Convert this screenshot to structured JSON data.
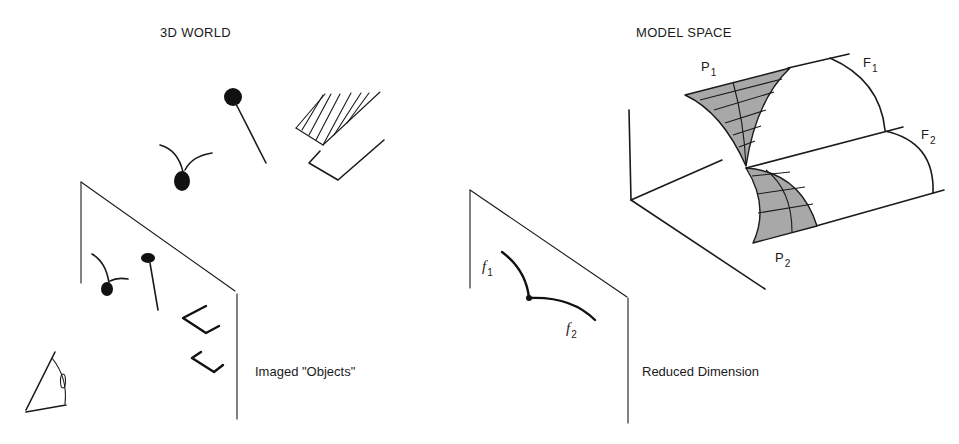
{
  "left_panel": {
    "title": "3D WORLD",
    "caption": "Imaged \"Objects\"",
    "icons": {
      "viewer": "eye-icon",
      "objects": [
        "seedling-object",
        "pin-object",
        "hatched-wedge-object",
        "bracket-object"
      ]
    }
  },
  "right_panel": {
    "title": "MODEL SPACE",
    "caption": "Reduced Dimension",
    "labels": {
      "P1": {
        "base": "P",
        "sub": "1"
      },
      "P2": {
        "base": "P",
        "sub": "2"
      },
      "F1": {
        "base": "F",
        "sub": "1"
      },
      "F2": {
        "base": "F",
        "sub": "2"
      },
      "f1": {
        "base": "f",
        "sub": "1"
      },
      "f2": {
        "base": "f",
        "sub": "2"
      }
    }
  },
  "colors": {
    "ink": "#1a1a1a",
    "patch_fill": "#a8a8a8",
    "background": "#ffffff"
  }
}
